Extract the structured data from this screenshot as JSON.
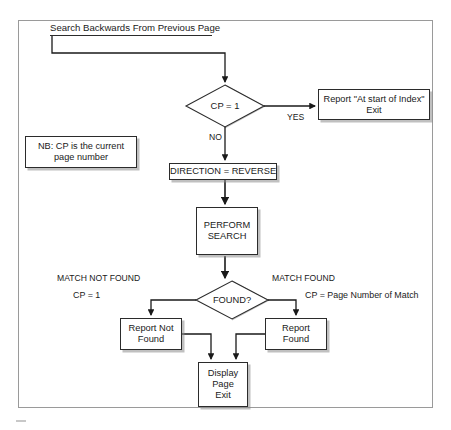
{
  "figure": {
    "type": "flowchart",
    "title_node": "Search Backwards From Previous Page",
    "note": {
      "line1": "NB: CP is the current",
      "line2": "page number"
    }
  },
  "nodes": {
    "start": {
      "label": "Search Backwards From Previous Page",
      "shape": "header"
    },
    "cp_equals_one": {
      "label": "CP = 1",
      "shape": "diamond"
    },
    "report_at_start": {
      "line1": "Report \"At start of Index\"",
      "line2": "Exit",
      "shape": "rect"
    },
    "direction_reverse": {
      "label": "DIRECTION = REVERSE",
      "shape": "rect"
    },
    "perform_search": {
      "line1": "PERFORM",
      "line2": "SEARCH",
      "shape": "rect"
    },
    "found_question": {
      "label": "FOUND?",
      "shape": "diamond"
    },
    "report_not_found": {
      "line1": "Report Not",
      "line2": "Found",
      "shape": "rect"
    },
    "report_found": {
      "line1": "Report",
      "line2": "Found",
      "shape": "rect"
    },
    "display_page_exit": {
      "line1": "Display",
      "line2": "Page",
      "line3": "Exit",
      "shape": "rect"
    }
  },
  "edge_labels": {
    "yes": "YES",
    "no": "NO",
    "match_not_found": "MATCH NOT FOUND",
    "cp_equals_1": "CP = 1",
    "match_found": "MATCH FOUND",
    "cp_page_number_of_match": "CP = Page Number of Match"
  },
  "colors": {
    "stroke": "#2b2b2b",
    "frame": "#9a9a9a",
    "shadow": "#8c8c8c",
    "background": "#ffffff",
    "text": "#1a1a1a"
  }
}
